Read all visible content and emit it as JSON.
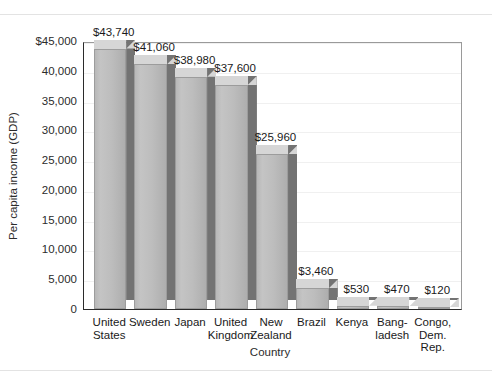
{
  "chart_data": {
    "type": "bar",
    "title": "",
    "xlabel": "Country",
    "ylabel": "Per capita income (GDP)",
    "ylim": [
      0,
      45000
    ],
    "ytick_values": [
      45000,
      40000,
      35000,
      30000,
      25000,
      20000,
      15000,
      10000,
      5000,
      0
    ],
    "ytick_labels": [
      "$45,000",
      "40,000",
      "35,000",
      "30,000",
      "25,000",
      "20,000",
      "15,000",
      "10,000",
      "5,000",
      "0"
    ],
    "grid": true,
    "legend": "none",
    "categories": [
      "United States",
      "Sweden",
      "Japan",
      "United Kingdom",
      "New Zealand",
      "Brazil",
      "Kenya",
      "Bangladesh",
      "Congo, Dem. Rep."
    ],
    "category_lines": [
      [
        "United",
        "States"
      ],
      [
        "Sweden"
      ],
      [
        "Japan"
      ],
      [
        "United",
        "Kingdom"
      ],
      [
        "New",
        "Zealand"
      ],
      [
        "Brazil"
      ],
      [
        "Kenya"
      ],
      [
        "Bang-",
        "ladesh"
      ],
      [
        "Congo,",
        "Dem.",
        "Rep."
      ]
    ],
    "values": [
      43740,
      41060,
      38980,
      37600,
      25960,
      3460,
      530,
      470,
      120
    ],
    "value_labels": [
      "$43,740",
      "$41,060",
      "$38,980",
      "$37,600",
      "$25,960",
      "$3,460",
      "$530",
      "$470",
      "$120"
    ],
    "colors": {
      "bar_front": "#bdbdbd",
      "bar_top": "#d6d6d6",
      "bar_side": "#737373",
      "axis": "#2b2b2b",
      "grid": "#f0f0f0",
      "background": "#ffffff"
    }
  }
}
